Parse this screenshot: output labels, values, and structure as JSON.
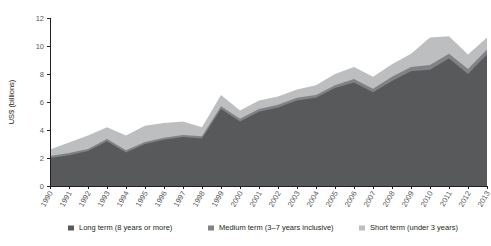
{
  "chart_data": {
    "type": "area",
    "stacked": true,
    "title": "",
    "xlabel": "",
    "ylabel": "US$ (billions)",
    "ylim": [
      0,
      12
    ],
    "yticks": [
      0,
      2,
      4,
      6,
      8,
      10,
      12
    ],
    "grid": false,
    "legend_position": "bottom",
    "categories": [
      "1990",
      "1991",
      "1992",
      "1993",
      "1994",
      "1995",
      "1996",
      "1997",
      "1998",
      "1999",
      "2000",
      "2001",
      "2002",
      "2003",
      "2004",
      "2005",
      "2006",
      "2007",
      "2008",
      "2009",
      "2010",
      "2011",
      "2012",
      "2013"
    ],
    "series": [
      {
        "name": "Long term (8 years or more)",
        "color": "#58595b",
        "values": [
          2.0,
          2.2,
          2.5,
          3.2,
          2.4,
          3.0,
          3.3,
          3.5,
          3.4,
          5.5,
          4.6,
          5.3,
          5.6,
          6.1,
          6.3,
          7.0,
          7.4,
          6.7,
          7.5,
          8.2,
          8.3,
          9.1,
          8.0,
          9.4
        ]
      },
      {
        "name": "Medium term (3–7 years inclusive)",
        "color": "#808285",
        "values": [
          0.15,
          0.15,
          0.15,
          0.15,
          0.15,
          0.15,
          0.15,
          0.15,
          0.15,
          0.2,
          0.2,
          0.2,
          0.2,
          0.2,
          0.2,
          0.2,
          0.25,
          0.25,
          0.3,
          0.3,
          0.35,
          0.35,
          0.35,
          0.35
        ]
      },
      {
        "name": "Short term (under 3 years)",
        "color": "#bcbec0",
        "values": [
          0.45,
          0.75,
          0.95,
          0.85,
          1.05,
          1.15,
          1.05,
          0.95,
          0.65,
          0.8,
          0.6,
          0.6,
          0.6,
          0.6,
          0.7,
          0.8,
          0.85,
          0.85,
          0.9,
          0.95,
          1.95,
          1.25,
          1.05,
          0.85
        ]
      }
    ]
  },
  "legend": {
    "items": [
      {
        "label": "Long term (8 years or more)",
        "color": "#58595b"
      },
      {
        "label": "Medium term (3–7 years inclusive)",
        "color": "#808285"
      },
      {
        "label": "Short term (under 3 years)",
        "color": "#bcbec0"
      }
    ]
  }
}
